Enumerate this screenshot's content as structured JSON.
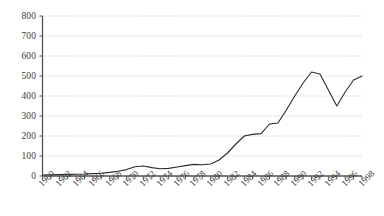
{
  "chart_data": {
    "type": "line",
    "title": "",
    "subtitle": "",
    "xlabel": "",
    "ylabel": "",
    "xlim": [
      1960,
      1998
    ],
    "ylim": [
      0,
      800
    ],
    "grid": true,
    "legend": null,
    "y_ticks": [
      0,
      100,
      200,
      300,
      400,
      500,
      600,
      700,
      800
    ],
    "y_tick_labels": [
      "0",
      "100",
      "200",
      "300",
      "400",
      "500",
      "600",
      "700",
      "800"
    ],
    "x_ticks": [
      1960,
      1962,
      1964,
      1966,
      1968,
      1970,
      1972,
      1974,
      1976,
      1978,
      1980,
      1982,
      1984,
      1986,
      1988,
      1990,
      1992,
      1994,
      1996,
      1998
    ],
    "x_tick_labels": [
      "1960",
      "1962",
      "1964",
      "1966",
      "1968",
      "1970",
      "1972",
      "1974",
      "1976",
      "1978",
      "1980",
      "1982",
      "1984",
      "1986",
      "1988",
      "1990",
      "1992",
      "1994",
      "1996",
      "1998"
    ],
    "x_minor_tick_interval": 1,
    "line_color": "#2b2b2b",
    "grid_color": "#b0b0b0",
    "axis_color": "#555555",
    "x": [
      1960,
      1961,
      1962,
      1963,
      1964,
      1965,
      1966,
      1967,
      1968,
      1969,
      1970,
      1971,
      1972,
      1973,
      1974,
      1975,
      1976,
      1977,
      1978,
      1979,
      1980,
      1981,
      1982,
      1983,
      1984,
      1985,
      1986,
      1987,
      1988,
      1989,
      1990,
      1991,
      1992,
      1993,
      1994,
      1995,
      1996,
      1997,
      1998
    ],
    "values": [
      5,
      6,
      7,
      8,
      9,
      10,
      12,
      14,
      18,
      24,
      32,
      46,
      50,
      42,
      36,
      38,
      45,
      52,
      58,
      56,
      60,
      80,
      115,
      160,
      200,
      208,
      212,
      260,
      265,
      330,
      400,
      465,
      520,
      510,
      430,
      350,
      420,
      480,
      500
    ],
    "series_name": ""
  }
}
